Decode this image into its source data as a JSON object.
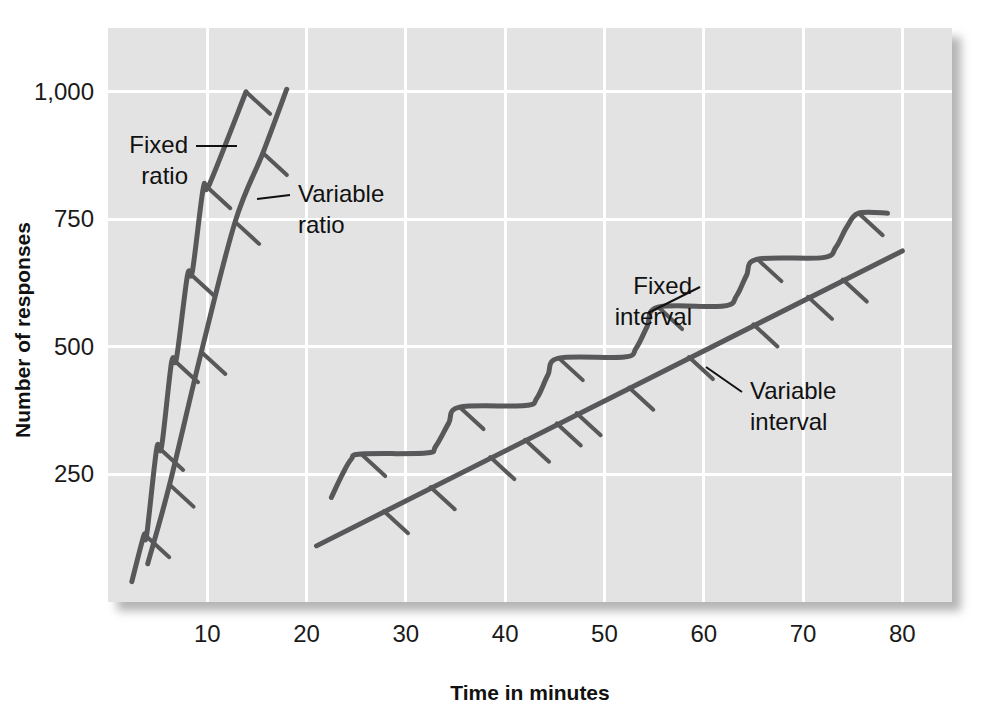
{
  "chart_data": {
    "type": "line",
    "title": "",
    "subtitle": "",
    "xlabel": "Time in minutes",
    "ylabel": "Number of responses",
    "xlim": [
      0,
      85
    ],
    "ylim": [
      0,
      1125
    ],
    "xticks": [
      10,
      20,
      30,
      40,
      50,
      60,
      70,
      80
    ],
    "xtick_labels": [
      "10",
      "20",
      "30",
      "40",
      "50",
      "60",
      "70",
      "80"
    ],
    "yticks": [
      250,
      500,
      750,
      1000
    ],
    "ytick_labels": [
      "250",
      "500",
      "750",
      "1,000"
    ],
    "grid": true,
    "grid_color": "#ffffff",
    "plot_background": "#e3e3e3",
    "line_color": "#58585a",
    "legend": "inline-annotations",
    "annotations": [
      {
        "name": "fixed-ratio",
        "label_line1": "Fixed",
        "label_line2": "ratio",
        "x": 5.5,
        "y": 900
      },
      {
        "name": "variable-ratio",
        "label_line1": "Variable",
        "label_line2": "ratio",
        "x": 19.5,
        "y": 820
      },
      {
        "name": "fixed-interval",
        "label_line1": "Fixed",
        "label_line2": "interval",
        "x": 55.5,
        "y": 690
      },
      {
        "name": "variable-interval",
        "label_line1": "Variable",
        "label_line2": "interval",
        "x": 71.0,
        "y": 420
      }
    ],
    "series": [
      {
        "name": "Fixed ratio",
        "description": "Steep staircase: rapid responding with short post-reinforcement pauses",
        "points": [
          [
            2.4,
            40
          ],
          [
            3.6,
            130
          ],
          [
            3.9,
            132
          ],
          [
            4.9,
            300
          ],
          [
            5.4,
            305
          ],
          [
            6.4,
            470
          ],
          [
            6.9,
            478
          ],
          [
            8.0,
            640
          ],
          [
            8.5,
            648
          ],
          [
            9.6,
            812
          ],
          [
            10.2,
            818
          ],
          [
            13.9,
            1000
          ]
        ],
        "reinforcement_ticks": [
          [
            3.75,
            131
          ],
          [
            5.15,
            302
          ],
          [
            6.65,
            474
          ],
          [
            8.25,
            644
          ],
          [
            9.9,
            815
          ],
          [
            13.9,
            1000
          ]
        ]
      },
      {
        "name": "Variable ratio",
        "description": "Steady high rate of responding, nearly straight steep line",
        "points": [
          [
            4.0,
            75
          ],
          [
            6.2,
            230
          ],
          [
            9.4,
            490
          ],
          [
            12.8,
            745
          ],
          [
            15.6,
            880
          ],
          [
            18.0,
            1005
          ]
        ],
        "reinforcement_ticks": [
          [
            6.2,
            230
          ],
          [
            9.4,
            490
          ],
          [
            12.8,
            745
          ],
          [
            15.6,
            880
          ]
        ]
      },
      {
        "name": "Fixed interval",
        "description": "Scalloped pattern: pause after reinforcement then accelerating responding",
        "points": [
          [
            22.5,
            205
          ],
          [
            23.6,
            250
          ],
          [
            24.5,
            280
          ],
          [
            25.5,
            290
          ],
          [
            32.0,
            292
          ],
          [
            33.0,
            305
          ],
          [
            34.3,
            350
          ],
          [
            35.4,
            382
          ],
          [
            42.0,
            385
          ],
          [
            43.2,
            400
          ],
          [
            44.3,
            445
          ],
          [
            45.4,
            478
          ],
          [
            52.0,
            480
          ],
          [
            53.2,
            498
          ],
          [
            54.3,
            540
          ],
          [
            55.4,
            578
          ],
          [
            62.0,
            580
          ],
          [
            63.3,
            600
          ],
          [
            64.3,
            640
          ],
          [
            65.4,
            672
          ],
          [
            72.0,
            675
          ],
          [
            73.3,
            695
          ],
          [
            74.4,
            735
          ],
          [
            75.6,
            762
          ],
          [
            78.5,
            762
          ]
        ],
        "reinforcement_ticks": [
          [
            25.5,
            290
          ],
          [
            35.4,
            382
          ],
          [
            45.4,
            478
          ],
          [
            55.4,
            578
          ],
          [
            65.4,
            672
          ],
          [
            75.6,
            762
          ]
        ]
      },
      {
        "name": "Variable interval",
        "description": "Steady moderate rate of responding, straight line",
        "points": [
          [
            21.0,
            110
          ],
          [
            80.0,
            688
          ]
        ],
        "reinforcement_ticks": [
          [
            27.8,
            178
          ],
          [
            32.5,
            225
          ],
          [
            38.5,
            284
          ],
          [
            42.0,
            318
          ],
          [
            45.2,
            350
          ],
          [
            47.2,
            370
          ],
          [
            52.5,
            420
          ],
          [
            58.5,
            480
          ],
          [
            65.0,
            544
          ],
          [
            70.5,
            598
          ],
          [
            74.0,
            632
          ]
        ]
      }
    ]
  },
  "axes": {
    "x_title": "Time in minutes",
    "y_title": "Number of responses"
  }
}
